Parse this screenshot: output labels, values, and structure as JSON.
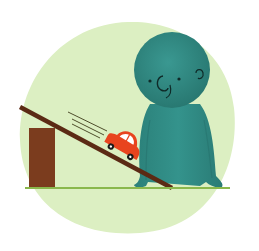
{
  "illustration": {
    "description": "Teal cartoon character watching a red toy car roll down a brown ramp propped on a block",
    "colors": {
      "background_circle": "#dcefc2",
      "ground_line": "#8ab84c",
      "block": "#7b3c1e",
      "ramp": "#5b2a14",
      "character": "#2f8b85",
      "character_shadow": "#26736e",
      "car_body": "#e8441e",
      "car_window": "#ffffff",
      "wheel": "#1a1a1a",
      "speed_lines": "#3d3a1a"
    },
    "elements": [
      "background-circle",
      "ground-line",
      "block",
      "ramp",
      "toy-car",
      "speed-lines",
      "character"
    ]
  }
}
